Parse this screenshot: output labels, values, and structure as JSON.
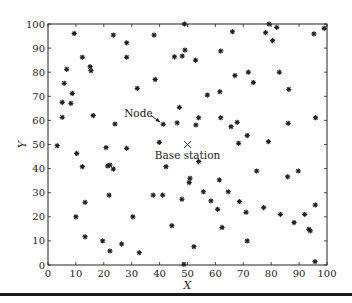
{
  "chart_data": {
    "type": "scatter",
    "title": "",
    "xlabel": "X",
    "ylabel": "Y",
    "xlim": [
      0,
      100
    ],
    "ylim": [
      0,
      100
    ],
    "grid": false,
    "legend": null,
    "x_ticks": [
      0,
      10,
      20,
      30,
      40,
      50,
      60,
      70,
      80,
      90,
      100
    ],
    "y_ticks": [
      0,
      10,
      20,
      30,
      40,
      50,
      60,
      70,
      80,
      90,
      100
    ],
    "series": [
      {
        "name": "Nodes",
        "marker": "*",
        "color": "#222222",
        "points": [
          [
            9.4,
            96.1
          ],
          [
            23.4,
            95.4
          ],
          [
            28.2,
            92.2
          ],
          [
            12.3,
            86.2
          ],
          [
            28.2,
            86.2
          ],
          [
            6.7,
            81.2
          ],
          [
            15.1,
            82.3
          ],
          [
            15.4,
            80.6
          ],
          [
            5.8,
            75.4
          ],
          [
            8.7,
            71.2
          ],
          [
            32.0,
            73.3
          ],
          [
            48.9,
            100.0
          ],
          [
            38.0,
            95.4
          ],
          [
            66.1,
            96.8
          ],
          [
            49.1,
            89.2
          ],
          [
            45.3,
            86.4
          ],
          [
            48.1,
            86.7
          ],
          [
            52.9,
            85.0
          ],
          [
            61.9,
            88.8
          ],
          [
            38.4,
            77.0
          ],
          [
            67.0,
            78.6
          ],
          [
            57.1,
            70.5
          ],
          [
            61.6,
            71.9
          ],
          [
            79.2,
            100.0
          ],
          [
            82.0,
            98.6
          ],
          [
            78.0,
            96.4
          ],
          [
            99.0,
            98.2
          ],
          [
            95.3,
            95.9
          ],
          [
            80.5,
            93.1
          ],
          [
            71.8,
            80.0
          ],
          [
            82.9,
            80.0
          ],
          [
            73.6,
            75.7
          ],
          [
            86.3,
            72.9
          ],
          [
            5.1,
            67.5
          ],
          [
            8.2,
            67.1
          ],
          [
            5.1,
            61.3
          ],
          [
            16.2,
            62.0
          ],
          [
            24.0,
            58.5
          ],
          [
            3.3,
            49.5
          ],
          [
            20.8,
            48.7
          ],
          [
            28.2,
            48.4
          ],
          [
            10.3,
            46.3
          ],
          [
            12.3,
            40.8
          ],
          [
            21.4,
            41.1
          ],
          [
            22.2,
            41.5
          ],
          [
            23.4,
            39.8
          ],
          [
            47.1,
            65.4
          ],
          [
            41.3,
            58.4
          ],
          [
            46.3,
            59.0
          ],
          [
            54.0,
            61.1
          ],
          [
            53.0,
            58.1
          ],
          [
            61.9,
            61.1
          ],
          [
            65.6,
            57.4
          ],
          [
            67.8,
            59.2
          ],
          [
            39.9,
            50.9
          ],
          [
            68.3,
            50.5
          ],
          [
            54.0,
            42.9
          ],
          [
            42.3,
            40.8
          ],
          [
            71.4,
            53.7
          ],
          [
            79.0,
            51.2
          ],
          [
            86.1,
            58.8
          ],
          [
            95.9,
            61.1
          ],
          [
            74.8,
            39.0
          ],
          [
            89.7,
            39.0
          ],
          [
            21.9,
            29.0
          ],
          [
            13.3,
            26.0
          ],
          [
            10.0,
            20.0
          ],
          [
            30.4,
            20.0
          ],
          [
            13.3,
            11.7
          ],
          [
            19.6,
            10.0
          ],
          [
            22.2,
            5.8
          ],
          [
            26.4,
            8.7
          ],
          [
            32.7,
            5.1
          ],
          [
            50.9,
            36.0
          ],
          [
            50.6,
            34.2
          ],
          [
            61.4,
            35.3
          ],
          [
            37.7,
            29.0
          ],
          [
            41.1,
            29.0
          ],
          [
            48.0,
            27.3
          ],
          [
            55.7,
            30.4
          ],
          [
            64.6,
            30.4
          ],
          [
            58.4,
            26.6
          ],
          [
            68.6,
            26.3
          ],
          [
            60.8,
            23.1
          ],
          [
            44.4,
            16.3
          ],
          [
            62.4,
            15.6
          ],
          [
            52.3,
            7.6
          ],
          [
            48.7,
            0.3
          ],
          [
            85.9,
            36.6
          ],
          [
            71.0,
            21.9
          ],
          [
            77.3,
            23.8
          ],
          [
            83.3,
            21.0
          ],
          [
            88.2,
            17.6
          ],
          [
            92.0,
            21.0
          ],
          [
            95.8,
            24.9
          ],
          [
            93.5,
            14.8
          ],
          [
            94.0,
            14.2
          ],
          [
            71.4,
            10.0
          ],
          [
            95.7,
            1.4
          ]
        ]
      },
      {
        "name": "Base station",
        "marker": "x",
        "color": "#222222",
        "points": [
          [
            50,
            50
          ]
        ]
      }
    ],
    "annotations": [
      {
        "text": "Node",
        "text_xy": [
          37.5,
          63.0
        ],
        "arrow_to": [
          41.3,
          58.4
        ]
      },
      {
        "text": "Base station",
        "text_xy": [
          50,
          45.5
        ]
      }
    ]
  },
  "labels": {
    "xlabel": "X",
    "ylabel": "Y",
    "node_annotation": "Node",
    "base_station_annotation": "Base station"
  }
}
